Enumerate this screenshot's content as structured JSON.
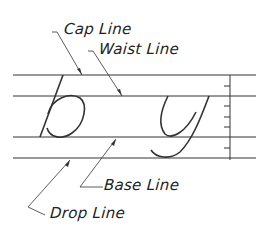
{
  "diagram": {
    "letters": [
      "b",
      "y"
    ],
    "labels": {
      "cap_line": "Cap Line",
      "waist_line": "Waist Line",
      "base_line": "Base Line",
      "drop_line": "Drop Line"
    },
    "colors": {
      "line": "#333333",
      "background": "#ffffff"
    }
  }
}
